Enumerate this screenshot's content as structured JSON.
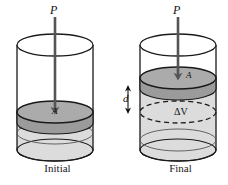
{
  "figure": {
    "type": "physics-diagram",
    "width": 228,
    "height": 185,
    "background": "#ffffff"
  },
  "colors": {
    "outline": "#1a1a1a",
    "piston_top": "#a8a8a8",
    "piston_side": "#8f8f8f",
    "fluid": "#dcdcdc",
    "fluid_side": "#d2d2d2",
    "arrow": "#555555",
    "text": "#101010",
    "dashed": "#1a1a1a"
  },
  "panels": [
    {
      "id": "initial",
      "caption": "Initial",
      "force_label": "P",
      "area_label": "A",
      "cylinder": {
        "center_x": 55,
        "left_x": 17,
        "right_x": 93,
        "top_y": 45,
        "bottom_y": 150,
        "rx": 38,
        "ry": 11
      },
      "piston": {
        "center_y": 112,
        "thickness": 11
      },
      "arrow": {
        "from_y": 17,
        "to_y": 114,
        "x": 55
      }
    },
    {
      "id": "final",
      "caption": "Final",
      "force_label": "P",
      "area_label": "A",
      "volume_label": "ΔV",
      "distance_label": "d",
      "cylinder": {
        "center_x": 178,
        "left_x": 140,
        "right_x": 216,
        "top_y": 45,
        "bottom_y": 150,
        "rx": 38,
        "ry": 11
      },
      "piston": {
        "center_y": 78,
        "thickness": 11
      },
      "delta_volume_ellipse": {
        "center_y": 112,
        "rx": 38,
        "ry": 11,
        "style": "dashed"
      },
      "distance_arrow": {
        "x": 128,
        "from_y": 86,
        "to_y": 112
      },
      "arrow": {
        "from_y": 17,
        "to_y": 80,
        "x": 178
      }
    }
  ]
}
